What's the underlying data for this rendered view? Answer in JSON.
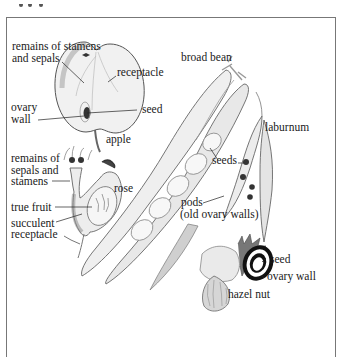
{
  "figure": {
    "title_fragment": "",
    "labels": {
      "apple_remains": [
        "remains of stamens",
        "and sepals"
      ],
      "apple_receptacle": "receptacle",
      "apple_ovary_wall": [
        "ovary",
        "wall"
      ],
      "apple_seed": "seed",
      "apple_name": "apple",
      "rose_remains": [
        "remains of",
        "sepals and",
        "stamens"
      ],
      "rose_name": "rose",
      "rose_true_fruit": "true fruit",
      "rose_succulent": [
        "succulent",
        "receptacle"
      ],
      "broad_bean": "broad bean",
      "laburnum": "laburnum",
      "seeds": "seeds",
      "pods": [
        "pods",
        "(old ovary walls)"
      ],
      "hazel_seed": "seed",
      "hazel_ovary_wall": "ovary wall",
      "hazel_name": "hazel nut"
    },
    "colors": {
      "frame": "#777777",
      "ink": "#1a1a1a",
      "fill_light": "#e6e6e6",
      "fill_mid": "#bdbdbd",
      "fill_dark": "#707070"
    }
  }
}
